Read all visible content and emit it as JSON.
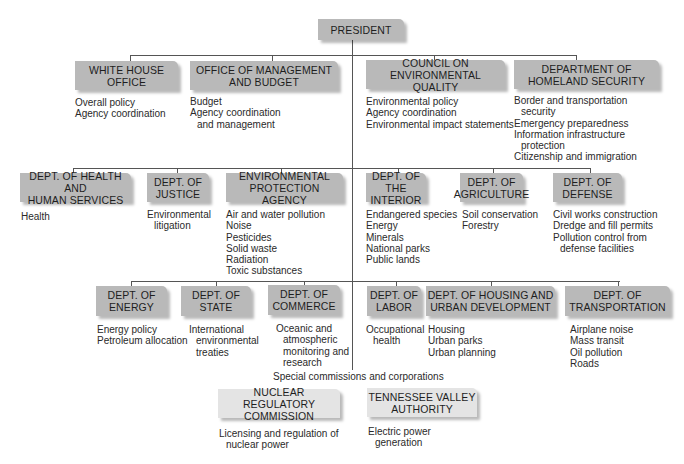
{
  "top": {
    "label": "PRESIDENT"
  },
  "row1": [
    {
      "label": "WHITE HOUSE\nOFFICE",
      "items": [
        "Overall policy",
        "Agency coordination"
      ]
    },
    {
      "label": "OFFICE OF MANAGEMENT\nAND BUDGET",
      "items": [
        "Budget",
        "Agency coordination",
        "and management"
      ]
    },
    {
      "label": "COUNCIL ON\nENVIRONMENTAL QUALITY",
      "items": [
        "Environmental policy",
        "Agency coordination",
        "Environmental impact statements"
      ]
    },
    {
      "label": "DEPARTMENT OF\nHOMELAND SECURITY",
      "items": [
        "Border and transportation",
        "security",
        "Emergency preparedness",
        "Information infrastructure",
        "protection",
        "Citizenship and immigration"
      ]
    }
  ],
  "row2": [
    {
      "label": "DEPT. OF HEALTH AND\nHUMAN SERVICES",
      "items": [
        "Health"
      ]
    },
    {
      "label": "DEPT. OF\nJUSTICE",
      "items": [
        "Environmental",
        "litigation"
      ]
    },
    {
      "label": "ENVIRONMENTAL\nPROTECTION AGENCY",
      "items": [
        "Air and water pollution",
        "Noise",
        "Pesticides",
        "Solid waste",
        "Radiation",
        "Toxic substances"
      ]
    },
    {
      "label": "DEPT. OF\nTHE INTERIOR",
      "items": [
        "Endangered species",
        "Energy",
        "Minerals",
        "National parks",
        "Public lands"
      ]
    },
    {
      "label": "DEPT. OF\nAGRICULTURE",
      "items": [
        "Soil conservation",
        "Forestry"
      ]
    },
    {
      "label": "DEPT. OF\nDEFENSE",
      "items": [
        "Civil works construction",
        "Dredge and fill permits",
        "Pollution control from",
        "defense facilities"
      ]
    }
  ],
  "row3": [
    {
      "label": "DEPT. OF\nENERGY",
      "items": [
        "Energy policy",
        "Petroleum allocation"
      ]
    },
    {
      "label": "DEPT. OF\nSTATE",
      "items": [
        "International",
        "environmental",
        "treaties"
      ]
    },
    {
      "label": "DEPT. OF\nCOMMERCE",
      "items": [
        "Oceanic and",
        "atmospheric",
        "monitoring and",
        "research"
      ]
    },
    {
      "label": "DEPT. OF\nLABOR",
      "items": [
        "Occupational",
        "health"
      ]
    },
    {
      "label": "DEPT. OF HOUSING AND\nURBAN DEVELOPMENT",
      "items": [
        "Housing",
        "Urban parks",
        "Urban planning"
      ]
    },
    {
      "label": "DEPT. OF\nTRANSPORTATION",
      "items": [
        "Airplane noise",
        "Mass transit",
        "Oil pollution",
        "Roads"
      ]
    }
  ],
  "special": {
    "heading": "Special commissions and corporations",
    "items": [
      {
        "label": "NUCLEAR REGULATORY\nCOMMISSION",
        "items": [
          "Licensing and regulation of",
          "nuclear power"
        ]
      },
      {
        "label": "TENNESSEE VALLEY\nAUTHORITY",
        "items": [
          "Electric power",
          "generation"
        ]
      }
    ]
  },
  "colors": {
    "box_dark": "#b9b9b9",
    "box_light": "#e4e4e4",
    "line": "#555555"
  }
}
